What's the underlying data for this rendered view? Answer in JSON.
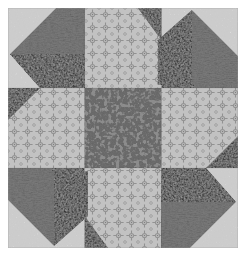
{
  "figure": {
    "title": "Pinwheel Quilt Block",
    "kind": "quilt-block-photograph",
    "canvas": {
      "width": 247,
      "height": 257,
      "background": "#ffffff"
    },
    "block": {
      "x": 8,
      "y": 8,
      "width": 230,
      "height": 240,
      "grid_rows": 3,
      "grid_cols": 3,
      "cell_width": 76.67,
      "cell_height": 80
    }
  },
  "fabrics": [
    {
      "id": "mottled-light",
      "name": "mottled light speckled print",
      "base_color": "#c9c9c9",
      "speck_color": "#6e6e6e",
      "role": "corner background"
    },
    {
      "id": "geometric-print",
      "name": "small geometric floral print",
      "base_color": "#bfbfbf",
      "motif_color": "#8a8a8a",
      "role": "edge background"
    },
    {
      "id": "medium-dark",
      "name": "medium dark textured gray",
      "base_color": "#575757",
      "texture_color": "#3a3a3a",
      "role": "inner triangle"
    },
    {
      "id": "near-black",
      "name": "near black dotted solid",
      "base_color": "#2c2c2c",
      "texture_color": "#171717",
      "role": "outer parallelogram"
    },
    {
      "id": "center-gray",
      "name": "medium gray with dark flecks",
      "base_color": "#868686",
      "speck_color": "#2e2e2e",
      "role": "center square"
    }
  ],
  "cells": [
    {
      "name": "corner-top-left",
      "row": 0,
      "col": 0,
      "rotation": 0,
      "type": "pinwheel-corner"
    },
    {
      "name": "edge-top-center",
      "row": 0,
      "col": 1,
      "rotation": 0,
      "type": "edge"
    },
    {
      "name": "corner-top-right",
      "row": 0,
      "col": 2,
      "rotation": 90,
      "type": "pinwheel-corner"
    },
    {
      "name": "edge-middle-left",
      "row": 1,
      "col": 0,
      "rotation": 270,
      "type": "edge"
    },
    {
      "name": "center-square",
      "row": 1,
      "col": 1,
      "rotation": 0,
      "type": "center"
    },
    {
      "name": "edge-middle-right",
      "row": 1,
      "col": 2,
      "rotation": 90,
      "type": "edge"
    },
    {
      "name": "corner-bottom-left",
      "row": 2,
      "col": 0,
      "rotation": 270,
      "type": "pinwheel-corner"
    },
    {
      "name": "edge-bottom-center",
      "row": 2,
      "col": 1,
      "rotation": 180,
      "type": "edge"
    },
    {
      "name": "corner-bottom-right",
      "row": 2,
      "col": 2,
      "rotation": 180,
      "type": "pinwheel-corner"
    }
  ]
}
